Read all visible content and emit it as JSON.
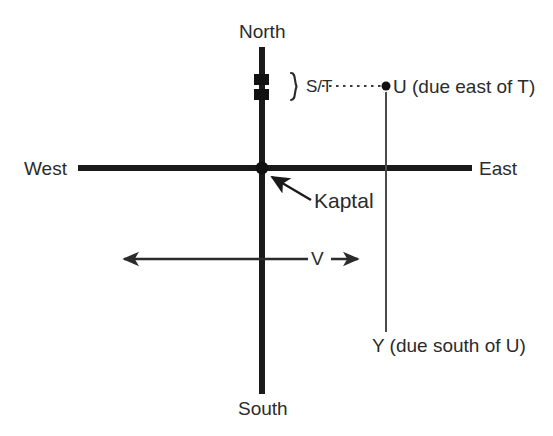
{
  "diagram": {
    "type": "compass-vector-diagram",
    "colors": {
      "axis": "#1a1a1a",
      "thin_line": "#4a4a4a",
      "text": "#2b2b2b",
      "background": "#ffffff"
    },
    "compass": {
      "north_label": "North",
      "south_label": "South",
      "west_label": "West",
      "east_label": "East"
    },
    "origin": {
      "name": "Kaptal",
      "label": "Kaptal",
      "marker": "filled-dot"
    },
    "segments": [
      {
        "id": "st",
        "label": "S/T",
        "brace": "}",
        "marker": "two-stacked-squares",
        "description": "segment on the north axis marked by two black squares with a brace"
      }
    ],
    "points": [
      {
        "id": "u",
        "label": "U (due east of T)",
        "marker": "filled-dot",
        "connector": "dotted-horizontal"
      },
      {
        "id": "y",
        "label": "Y (due south of U)",
        "marker": "none",
        "connector": "thin-vertical"
      }
    ],
    "vectors": [
      {
        "id": "v",
        "label": "V",
        "style": "double-headed-arrow",
        "description": "horizontal double-headed arrow below the east-west axis"
      }
    ]
  }
}
